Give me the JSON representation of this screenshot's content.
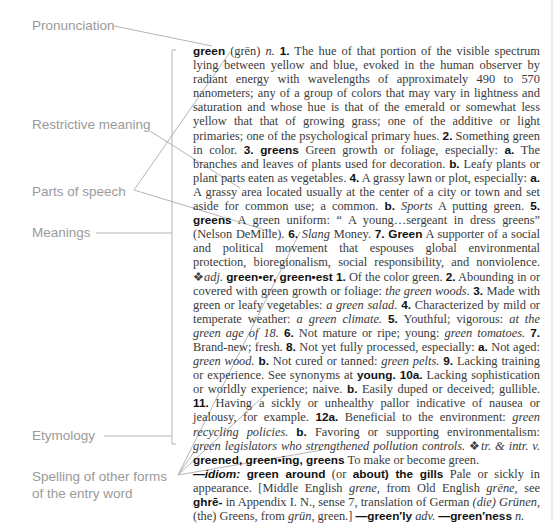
{
  "callouts": {
    "pronunciation": "Pronunciation",
    "restrictive_meaning": "Restrictive meaning",
    "parts_of_speech": "Parts of speech",
    "meanings": "Meanings",
    "etymology": "Etymology",
    "spelling_line1": "Spelling of other forms",
    "spelling_line2": "of the entry word"
  },
  "entry": {
    "headword": "green",
    "pronunciation": "(grēn)",
    "pos_noun": "n.",
    "s1_num": "1.",
    "s1_text": "The hue of that portion of the visible spectrum lying between yellow and blue, evoked in the human observer by radiant energy with wavelengths of approximately 490 to 570 nanometers; any of a group of colors that may vary in lightness and saturation and whose hue is that of the emerald or somewhat less yellow that that of growing grass; one of the additive or light primaries; one of the psychological primary hues.",
    "s2_num": "2.",
    "s2_text": "Something green in color.",
    "s3_num": "3.",
    "s3_form": "greens",
    "s3_text": "Green growth or foliage, especially:",
    "s3a_num": "a.",
    "s3a_text": "The branches and leaves of plants used for decoration.",
    "s3b_num": "b.",
    "s3b_text": "Leafy plants or plant parts eaten as vegetables.",
    "s4_num": "4.",
    "s4_text": "A grassy lawn or plot, especially:",
    "s4a_num": "a.",
    "s4a_text": "A grassy area located usually at the center of a city or town and set aside for common use; a common.",
    "s4b_num": "b.",
    "s4b_label": "Sports",
    "s4b_text": "A putting green.",
    "s5_num": "5.",
    "s5_form": "greens",
    "s5_text": "A green uniform: “ A young…sergeant in dress greens” (Nelson DeMille).",
    "s6_num": "6.",
    "s6_label": "Slang",
    "s6_text": "Money.",
    "s7_num": "7.",
    "s7_form": "Green",
    "s7_text": "A supporter of a social and political movement that espouses global environmental protection, bioregionalism, social responsibility, and nonviolence.",
    "adj_marker": "❖",
    "pos_adj": "adj.",
    "adj_forms": "green•er, green•est",
    "a1_num": "1.",
    "a1_text": "Of the color green.",
    "a2_num": "2.",
    "a2_text": "Abounding in or covered with green growth or foliage:",
    "a2_ex": "the green woods.",
    "a3_num": "3.",
    "a3_text": "Made with green or leafy vegetables:",
    "a3_ex": "a green salad.",
    "a4_num": "4.",
    "a4_text": "Characterized by mild or temperate weather:",
    "a4_ex": "a green climate.",
    "a5_num": "5.",
    "a5_text": "Youthful; vigorous:",
    "a5_ex": "at the green age of 18.",
    "a6_num": "6.",
    "a6_text": "Not mature or ripe; young:",
    "a6_ex": "green tomatoes.",
    "a7_num": "7.",
    "a7_text": "Brand-new; fresh.",
    "a8_num": "8.",
    "a8_text": "Not yet fully processed, especially:",
    "a8a_num": "a.",
    "a8a_text": "Not aged:",
    "a8a_ex": "green wood.",
    "a8b_num": "b.",
    "a8b_text": "Not cured or tanned:",
    "a8b_ex": "green pelts.",
    "a9_num": "9.",
    "a9_text": "Lacking training or experience. See synonyms at",
    "a9_xref": "young.",
    "a10_num": "10a.",
    "a10a_text": "Lacking sophistication or worldly experience; naive.",
    "a10b_num": "b.",
    "a10b_text": "Easily duped or deceived; gullible.",
    "a11_num": "11.",
    "a11_text": "Having a sickly or unhealthy pallor indicative of nausea or jealousy, for example.",
    "a12_num": "12a.",
    "a12a_text": "Beneficial to the environment:",
    "a12a_ex": "green recycling policies.",
    "a12b_num": "b.",
    "a12b_text": "Favoring or supporting environmentalism:",
    "a12b_ex": "green legislators who strengthened pollution controls.",
    "verb_marker": "❖",
    "pos_verb": "tr. & intr. v.",
    "verb_forms": "greened, green•ing, greens",
    "verb_text": "To make or become green.",
    "idiom_label": "—idiom:",
    "idiom_phrase": "green around",
    "idiom_or": "(or",
    "idiom_alt": "about) the gills",
    "idiom_text": "Pale or sickly in appearance.",
    "etym_1": "[Middle English",
    "etym_me": "grene,",
    "etym_2": "from Old English",
    "etym_oe": "grēne,",
    "etym_3": "see",
    "etym_root": "ghrē-",
    "etym_4": "in Appendix I. N., sense 7, translation of German",
    "etym_de": "(die) Grünen,",
    "etym_5": "(the) Greens, from",
    "etym_grun": "grün,",
    "etym_6": "green.]",
    "deriv1_form": "—green′ly",
    "deriv1_pos": "adv.",
    "deriv2_form": "—green′ness",
    "deriv2_pos": "n."
  },
  "colors": {
    "callout_text": "#9a9a9a",
    "leader_line": "#b4b4b4",
    "body_text": "#3a3a3a",
    "bold_text": "#111111"
  }
}
